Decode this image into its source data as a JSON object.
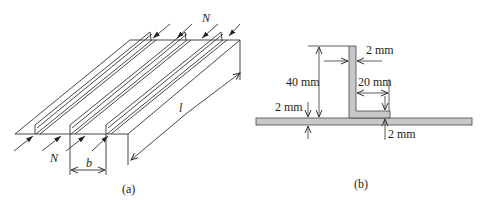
{
  "figure_a": {
    "caption": "(a)",
    "load_label_top": "N",
    "load_label_bottom": "N",
    "spacing_label": "b",
    "length_label": "l"
  },
  "figure_b": {
    "caption": "(b)",
    "web_height": "40 mm",
    "web_thickness": "2 mm",
    "flange_width": "20 mm",
    "flange_thickness": "2 mm",
    "plate_thickness": "2 mm",
    "section_fill": "#c8c8c8"
  }
}
